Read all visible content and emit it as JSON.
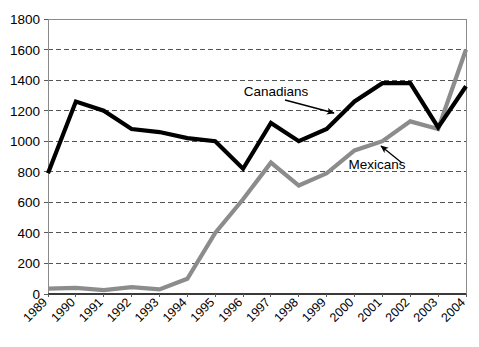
{
  "chart_data": {
    "type": "line",
    "title": "",
    "subtitle": "",
    "xlabel": "",
    "ylabel": "",
    "categories": [
      "1989",
      "1990",
      "1991",
      "1992",
      "1993",
      "1994",
      "1995",
      "1996",
      "1997",
      "1998",
      "1999",
      "2000",
      "2001",
      "2002",
      "2003",
      "2004"
    ],
    "ylim": [
      0,
      1800
    ],
    "ytick_step": 200,
    "yticks": [
      "1800",
      "1600",
      "1400",
      "1200",
      "1000",
      "800",
      "600",
      "400",
      "200",
      "0"
    ],
    "ytick_values": [
      1800,
      1600,
      1400,
      1200,
      1000,
      800,
      600,
      400,
      200,
      0
    ],
    "grid": "horizontal-dashed",
    "legend_position": "inline-annotations",
    "series": [
      {
        "name": "Canadians",
        "color": "#000000",
        "values": [
          790,
          1260,
          1200,
          1080,
          1060,
          1020,
          1000,
          820,
          1120,
          1000,
          1080,
          1260,
          1380,
          1380,
          1090,
          1360
        ]
      },
      {
        "name": "Mexicans",
        "color": "#8c8c8c",
        "values": [
          35,
          40,
          25,
          45,
          30,
          100,
          400,
          620,
          860,
          710,
          790,
          940,
          1000,
          1130,
          1080,
          1600
        ]
      }
    ],
    "annotations": [
      {
        "text": "Canadians",
        "series": "Canadians",
        "x_px": 276,
        "y_px": 96,
        "arrow_from_x": 285,
        "arrow_from_y": 100,
        "arrow_to_x": 334,
        "arrow_to_y": 113
      },
      {
        "text": "Mexicans",
        "series": "Mexicans",
        "x_px": 377,
        "y_px": 169,
        "arrow_from_x": 402,
        "arrow_from_y": 163,
        "arrow_to_x": 381,
        "arrow_to_y": 146
      }
    ]
  },
  "axes": {
    "plot_left_px": 48,
    "plot_right_px": 466,
    "plot_top_px": 19,
    "plot_bottom_px": 294,
    "axis_color": "#808080",
    "grid_color": "#555555"
  }
}
